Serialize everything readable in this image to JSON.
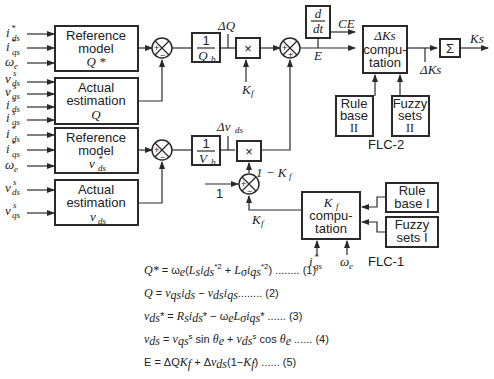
{
  "inputs": {
    "q_ref": [
      {
        "sym": "i",
        "sub": "ds",
        "sup": "*"
      },
      {
        "sym": "i",
        "sub": "qs",
        "sup": "*"
      },
      {
        "sym": "ω",
        "sub": "e",
        "sup": ""
      }
    ],
    "q_act": [
      {
        "sym": "v",
        "sub": "ds",
        "sup": "s"
      },
      {
        "sym": "v",
        "sub": "qs",
        "sup": "s"
      },
      {
        "sym": "i",
        "sub": "ds",
        "sup": "s"
      },
      {
        "sym": "i",
        "sub": "qs",
        "sup": "s"
      }
    ],
    "v_ref": [
      {
        "sym": "i",
        "sub": "ds",
        "sup": "*"
      },
      {
        "sym": "i",
        "sub": "qs",
        "sup": "*"
      },
      {
        "sym": "ω",
        "sub": "e",
        "sup": ""
      }
    ],
    "v_act": [
      {
        "sym": "v",
        "sub": "ds",
        "sup": "s"
      },
      {
        "sym": "v",
        "sub": "qs",
        "sup": "s"
      }
    ]
  },
  "blocks": {
    "ref_q": {
      "line1": "Reference",
      "line2": "model",
      "line3": "Q *"
    },
    "act_q": {
      "line1": "Actual",
      "line2": "estimation",
      "line3": "Q"
    },
    "ref_v": {
      "line1": "Reference",
      "line2": "model",
      "line3": "v*ds"
    },
    "act_v": {
      "line1": "Actual",
      "line2": "estimation",
      "line3": "vds"
    },
    "gain_q": {
      "num": "1",
      "den": "Qb"
    },
    "gain_v": {
      "num": "1",
      "den": "Vb"
    },
    "mult": "×",
    "deriv": {
      "num": "d",
      "den": "dt"
    },
    "dks": {
      "line1": "ΔKs",
      "line2": "compu-",
      "line3": "tation"
    },
    "sum": "Σ",
    "rule2": {
      "line1": "Rule",
      "line2": "base",
      "line3": "II"
    },
    "fuzzy2": {
      "line1": "Fuzzy",
      "line2": "sets",
      "line3": "II"
    },
    "kf": {
      "line1": "Kf",
      "line2": "compu-",
      "line3": "tation"
    },
    "rule1": {
      "line1": "Rule",
      "line2": "base I"
    },
    "fuzzy1": {
      "line1": "Fuzzy",
      "line2": "sets I"
    }
  },
  "signals": {
    "dq": "ΔQ",
    "dv": "Δv",
    "dv_sub": "ds",
    "kf": "K",
    "kf_sub": "f",
    "one_minus_kf": "1 − K",
    "one": "1",
    "e": "E",
    "ce": "CE",
    "ks": "Ks",
    "dks": "ΔKs",
    "iqs": "i*qs",
    "we": "ωe"
  },
  "labels": {
    "flc2": "FLC-2",
    "flc1": "FLC-1"
  },
  "equations": [
    "Q* = ωe(Ls ids*2 + Lσ iqs*2) ........ (1)",
    "Q = vqs ids − vds iqs........ (2)",
    "vds* = Rs ids* − ωe Lσ iqs* ...... (3)",
    "vds = vqs^s sin θe + vds^s cos θe ...... (4)",
    "E = ΔQKf + Δvds(1−Kf) ...... (5)"
  ],
  "colors": {
    "ink": "#2a2a2a",
    "background": "#ffffff"
  }
}
